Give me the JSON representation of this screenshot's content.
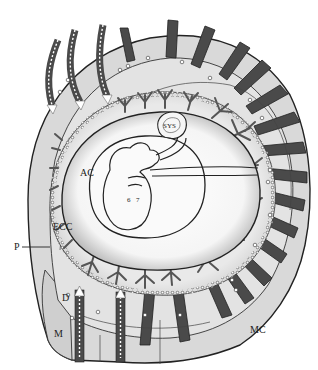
{
  "diagram": {
    "type": "anatomical-illustration",
    "labels": {
      "ac": "AC",
      "ecc": "ECC",
      "sys": "SYS",
      "p": "P",
      "d": "D",
      "m": "M",
      "mc": "MC"
    },
    "colors": {
      "background": "#ffffff",
      "outline": "#222222",
      "tissue_light": "#d9d9d9",
      "tissue_mid": "#c4c4c4",
      "spiral_artery": "#4a4a4a",
      "villi": "#6e6e6e",
      "cavity": "#f4f4f4",
      "flow_arrow": "#ffffff"
    },
    "features": {
      "flow_arrows_top": 3,
      "flow_arrows_bottom": 2,
      "radial_vessels": 20
    }
  }
}
